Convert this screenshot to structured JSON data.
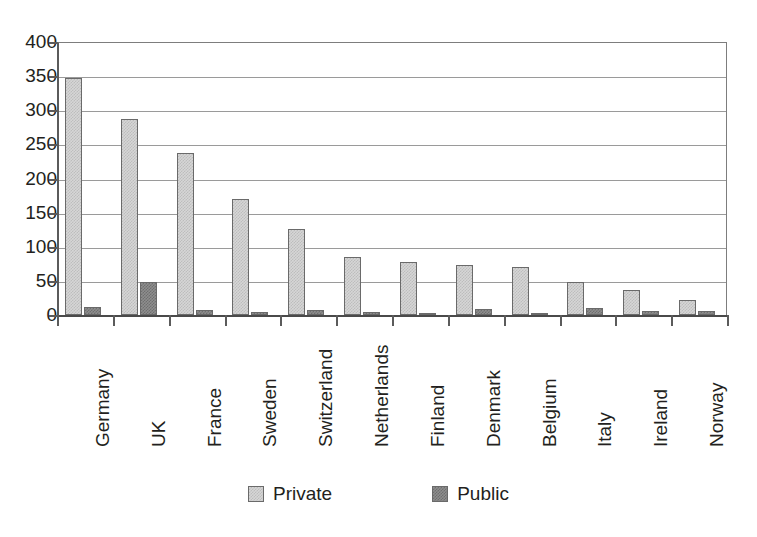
{
  "chart_data": {
    "type": "bar",
    "title": "",
    "subtitle": "",
    "xlabel": "",
    "ylabel": "",
    "ylim": [
      0,
      400
    ],
    "yticks": [
      0,
      50,
      100,
      150,
      200,
      250,
      300,
      350,
      400
    ],
    "ytick_labels": [
      "0",
      "50",
      "100",
      "150",
      "200",
      "250",
      "300",
      "350",
      "400"
    ],
    "grid": true,
    "legend_position": "bottom-center",
    "categories": [
      "Germany",
      "UK",
      "France",
      "Sweden",
      "Switzerland",
      "Netherlands",
      "Finland",
      "Denmark",
      "Belgium",
      "Italy",
      "Ireland",
      "Norway"
    ],
    "series": [
      {
        "name": "Private",
        "color": "#d6d6d6",
        "values": [
          348,
          287,
          237,
          170,
          126,
          85,
          77,
          74,
          71,
          48,
          37,
          22
        ]
      },
      {
        "name": "Public",
        "color": "#8e8e8e",
        "values": [
          12,
          48,
          7,
          4,
          8,
          5,
          1,
          9,
          2,
          10,
          6,
          6
        ]
      }
    ]
  },
  "legend": {
    "items": [
      {
        "label": "Private",
        "swatch": "private-swatch"
      },
      {
        "label": "Public",
        "swatch": "public-swatch"
      }
    ]
  }
}
